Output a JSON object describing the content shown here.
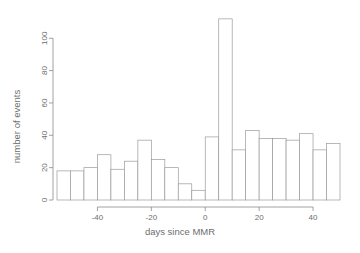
{
  "chart_data": {
    "type": "bar",
    "title": "",
    "subtitle": "",
    "xlabel": "days since MMR",
    "ylabel": "number of events",
    "bin_width": 5,
    "grid": false,
    "legend": null,
    "xlim": [
      -55,
      50
    ],
    "ylim": [
      0,
      115
    ],
    "xticks": [
      -40,
      -20,
      0,
      20,
      40
    ],
    "xtick_labels": [
      "-40",
      "-20",
      "0",
      "20",
      "40"
    ],
    "yticks": [
      0,
      20,
      40,
      60,
      80,
      100
    ],
    "ytick_labels": [
      "0",
      "20",
      "40",
      "60",
      "80",
      "100"
    ],
    "bin_starts": [
      -55,
      -50,
      -45,
      -40,
      -35,
      -30,
      -25,
      -20,
      -15,
      -10,
      -5,
      0,
      5,
      10,
      15,
      20,
      25,
      30,
      35,
      40,
      45
    ],
    "bin_ends": [
      -50,
      -45,
      -40,
      -35,
      -30,
      -25,
      -20,
      -15,
      -10,
      -5,
      0,
      5,
      10,
      15,
      20,
      25,
      30,
      35,
      40,
      45,
      50
    ],
    "categories": [
      "-55 to -50",
      "-50 to -45",
      "-45 to -40",
      "-40 to -35",
      "-35 to -30",
      "-30 to -25",
      "-25 to -20",
      "-20 to -15",
      "-15 to -10",
      "-10 to -5",
      "-5 to 0",
      "0 to 5",
      "5 to 10",
      "10 to 15",
      "15 to 20",
      "20 to 25",
      "25 to 30",
      "30 to 35",
      "35 to 40",
      "40 to 45",
      "45 to 50"
    ],
    "values": [
      18,
      18,
      20,
      28,
      19,
      24,
      37,
      25,
      20,
      10,
      6,
      39,
      112,
      31,
      43,
      38,
      38,
      37,
      41,
      31,
      35
    ]
  },
  "axis": {
    "ylabel": "number of events",
    "xlabel": "days since MMR"
  },
  "colors": {
    "bar_fill": "#ffffff",
    "bar_stroke": "#9a9a9a",
    "axis": "#8a8a8a",
    "text": "#6e6e6e",
    "background": "#ffffff"
  }
}
